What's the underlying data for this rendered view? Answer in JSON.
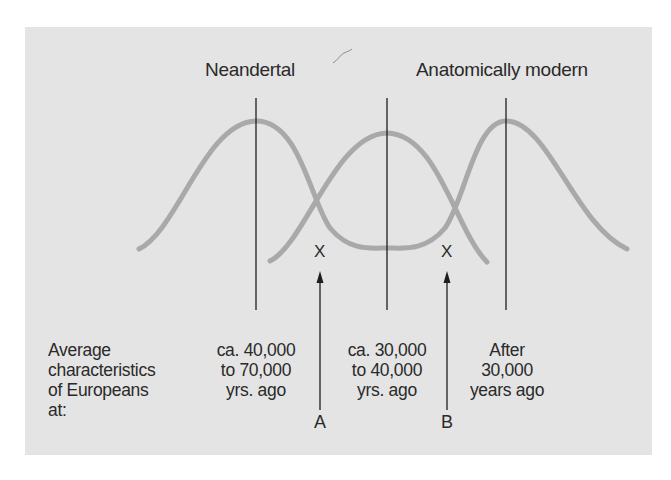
{
  "diagram": {
    "title_labels": {
      "left_population": "Neandertal",
      "right_population": "Anatomically modern"
    },
    "row_label": [
      "Average",
      "characteristics",
      "of Europeans",
      "at:"
    ],
    "periods": [
      {
        "lines": [
          "ca. 40,000",
          "to 70,000",
          "yrs. ago"
        ]
      },
      {
        "lines": [
          "ca. 30,000",
          "to 40,000",
          "yrs. ago"
        ]
      },
      {
        "lines": [
          "After",
          "30,000",
          "years ago"
        ]
      }
    ],
    "crossover_marks": [
      {
        "symbol": "X",
        "pointer_label": "A"
      },
      {
        "symbol": "X",
        "pointer_label": "B"
      }
    ],
    "colors": {
      "background": "#e4e4e4",
      "curve": "#a9a9a9",
      "line": "#1e1e1e",
      "text": "#2a2a2a"
    }
  }
}
